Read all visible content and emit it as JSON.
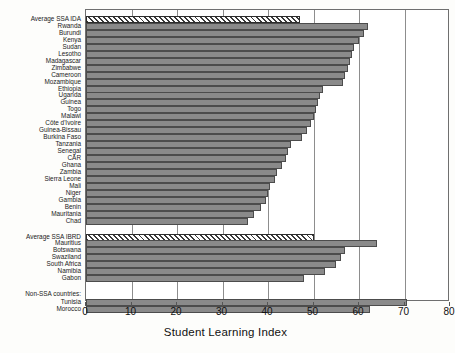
{
  "chart_data": {
    "type": "bar",
    "orientation": "horizontal",
    "title": "",
    "xlabel": "Student Learning Index",
    "ylabel": "",
    "xlim": [
      0,
      80
    ],
    "xticks": [
      0,
      10,
      20,
      30,
      40,
      50,
      60,
      70,
      80
    ],
    "grid": true,
    "legend": false,
    "group_labels": [
      "Non-SSA countries:"
    ],
    "categories": [
      "Average SSA IDA",
      "Rwanda",
      "Burundi",
      "Kenya",
      "Sudan",
      "Lesotho",
      "Madagascar",
      "Zimbabwe",
      "Cameroon",
      "Mozambique",
      "Ethiopia",
      "Uganda",
      "Guinea",
      "Togo",
      "Malawi",
      "Côte d'Ivoire",
      "Guinea-Bissau",
      "Burkina Faso",
      "Tanzania",
      "Senegal",
      "CAR",
      "Ghana",
      "Zambia",
      "Sierra Leone",
      "Mali",
      "Niger",
      "Gambia",
      "Benin",
      "Mauritania",
      "Chad",
      "Average SSA IBRD",
      "Mauritius",
      "Botswana",
      "Swaziland",
      "South Africa",
      "Namibia",
      "Gabon",
      "Tunisia",
      "Morocco"
    ],
    "values": [
      47.0,
      62.0,
      61.0,
      60.0,
      59.0,
      58.5,
      58.0,
      57.5,
      57.0,
      56.5,
      52.0,
      51.5,
      51.0,
      50.5,
      50.0,
      49.5,
      48.5,
      47.5,
      45.0,
      44.5,
      44.0,
      43.0,
      42.0,
      41.5,
      40.5,
      40.0,
      39.5,
      38.5,
      37.0,
      35.5,
      50.0,
      64.0,
      57.0,
      56.0,
      55.0,
      52.5,
      48.0,
      70.5,
      62.5
    ],
    "hatched_indices": [
      0,
      30
    ],
    "bar_color": "#8a8a8a",
    "bar_edge_color": "#4c4c4c",
    "hatch_color": "#3a3a3a"
  }
}
